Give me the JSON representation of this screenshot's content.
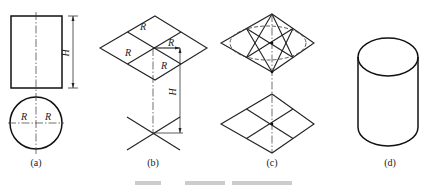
{
  "figure": {
    "panels": [
      {
        "id": "a",
        "label": "(a)",
        "description": "Orthographic views of cylinder: front rectangle with height H, top view circle with radius R"
      },
      {
        "id": "b",
        "label": "(b)",
        "description": "Isometric axes with rhombus of top face subdivided, radius R marked, height H dimension"
      },
      {
        "id": "c",
        "label": "(c)",
        "description": "Top and bottom rhombi with four-center ellipse construction"
      },
      {
        "id": "d",
        "label": "(d)",
        "description": "Finished isometric cylinder"
      }
    ],
    "dimension_labels": {
      "height": "H",
      "radius": "R"
    },
    "caption_partial": "图 ..."
  }
}
